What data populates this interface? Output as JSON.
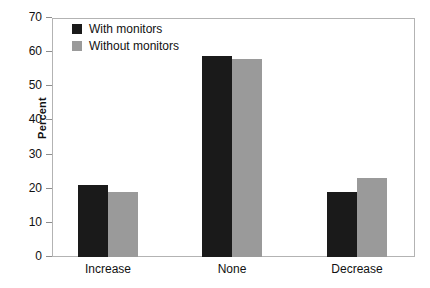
{
  "chart_data": {
    "type": "bar",
    "title": "",
    "xlabel": "",
    "ylabel": "Percent",
    "categories": [
      "Increase",
      "None",
      "Decrease"
    ],
    "series": [
      {
        "name": "With monitors",
        "values": [
          21,
          59,
          19
        ],
        "color": "#1a1a1a"
      },
      {
        "name": "Without monitors",
        "values": [
          19,
          58,
          23
        ],
        "color": "#9a9a9a"
      }
    ],
    "ylim": [
      0,
      70
    ],
    "ytick_step": 10,
    "yticks": [
      0,
      10,
      20,
      30,
      40,
      50,
      60,
      70
    ],
    "ytick_labels": [
      "0",
      "10",
      "20",
      "30",
      "40",
      "50",
      "60",
      "70"
    ],
    "grid": false,
    "legend_position": "top-left-inside",
    "frame_color": "#b3b3b3",
    "background": "#ffffff"
  }
}
